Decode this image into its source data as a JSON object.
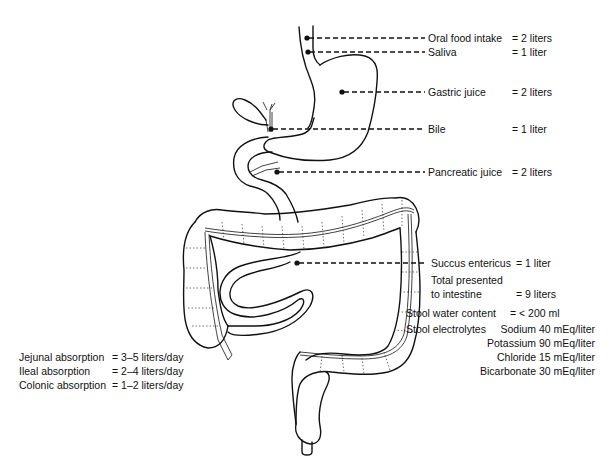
{
  "figure": {
    "inputs": [
      {
        "label": "Oral food intake",
        "value": "= 2 liters"
      },
      {
        "label": "Saliva",
        "value": "= 1 liter"
      },
      {
        "label": "Gastric juice",
        "value": "= 2 liters"
      },
      {
        "label": "Bile",
        "value": "= 1 liter"
      },
      {
        "label": "Pancreatic juice",
        "value": "= 2 liters"
      },
      {
        "label": "Succus entericus",
        "value": "= 1 liter"
      }
    ],
    "total": {
      "label_line1": "Total presented",
      "label_line2": "to intestine",
      "value": "= 9 liters"
    },
    "stool_water": {
      "label": "Stool water content",
      "value": "= < 200 ml"
    },
    "stool_electrolytes": {
      "label": "Stool electrolytes",
      "items": [
        "Sodium 40 mEq/liter",
        "Potassium 90 mEq/liter",
        "Chloride 15 mEq/liter",
        "Bicarbonate 30 mEq/liter"
      ]
    },
    "absorption": [
      {
        "label": "Jejunal absorption",
        "value": "= 3–5 liters/day"
      },
      {
        "label": "Ileal absorption",
        "value": "= 2–4 liters/day"
      },
      {
        "label": "Colonic absorption",
        "value": "= 1–2 liters/day"
      }
    ]
  }
}
